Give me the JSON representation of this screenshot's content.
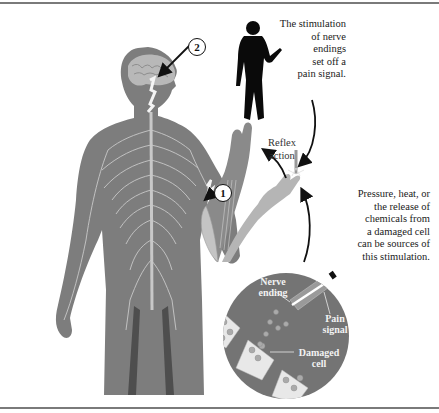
{
  "diagram": {
    "type": "pain-reflex-pathway",
    "colors": {
      "body": "#7d7d7d",
      "nerves": "#c8c8c8",
      "arm_reflex": "#8a8a8a",
      "arm_initial": "#b5b5b5",
      "inset_circle": "#747474",
      "cells": "#e8e8e8",
      "arrows": "#111111",
      "rule": "#7a7a7a"
    },
    "captions": {
      "stimulation": [
        "The stimulation",
        "of nerve",
        "endings",
        "set off a",
        "pain signal."
      ],
      "reflex": [
        "Reflex",
        "action"
      ],
      "sources": [
        "Pressure, heat, or",
        "the release of",
        "chemicals from",
        "a damaged cell",
        "can be sources of",
        "this stimulation."
      ]
    },
    "inset_labels": {
      "nerve_ending": [
        "Nerve",
        "ending"
      ],
      "pain_signal": [
        "Pain",
        "signal"
      ],
      "damaged_cell": [
        "Damaged",
        "cell"
      ]
    },
    "markers": {
      "step1": "1",
      "step2": "2"
    }
  }
}
